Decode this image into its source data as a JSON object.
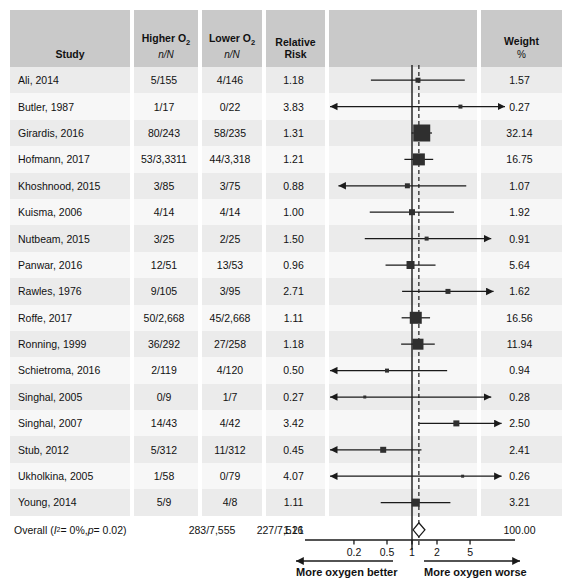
{
  "header": {
    "study": "Study",
    "higher_o2": "Higher O",
    "higher_o2_sub": "2",
    "higher_o2_unit": "n/N",
    "lower_o2": "Lower O",
    "lower_o2_sub": "2",
    "lower_o2_unit": "n/N",
    "relative_risk_l1": "Relative",
    "relative_risk_l2": "Risk",
    "weight_l1": "Weight",
    "weight_l2": "%"
  },
  "rows": [
    {
      "study": "Ali, 2014",
      "higher": "5/155",
      "lower": "4/146",
      "rr": "1.18",
      "weight": "1.57",
      "est": 1.18,
      "lo": 0.32,
      "hi": 4.32,
      "box": 5,
      "loArrow": false,
      "hiArrow": false
    },
    {
      "study": "Butler, 1987",
      "higher": "1/17",
      "lower": "0/22",
      "rr": "3.83",
      "weight": "0.27",
      "est": 3.83,
      "lo": 0.1,
      "hi": 30.0,
      "box": 4,
      "loArrow": true,
      "hiArrow": true
    },
    {
      "study": "Girardis, 2016",
      "higher": "80/243",
      "lower": "58/235",
      "rr": "1.31",
      "weight": "32.14",
      "est": 1.31,
      "lo": 0.99,
      "hi": 1.74,
      "box": 17,
      "loArrow": false,
      "hiArrow": false
    },
    {
      "study": "Hofmann, 2017",
      "higher": "53/3,3311",
      "lower": "44/3,318",
      "rr": "1.21",
      "weight": "16.75",
      "est": 1.21,
      "lo": 0.81,
      "hi": 1.8,
      "box": 12,
      "loArrow": false,
      "hiArrow": false
    },
    {
      "study": "Khoshnood, 2015",
      "higher": "3/85",
      "lower": "3/75",
      "rr": "0.88",
      "weight": "1.07",
      "est": 0.88,
      "lo": 0.13,
      "hi": 4.5,
      "box": 5,
      "loArrow": true,
      "hiArrow": false
    },
    {
      "study": "Kuisma, 2006",
      "higher": "4/14",
      "lower": "4/14",
      "rr": "1.00",
      "weight": "1.92",
      "est": 1.0,
      "lo": 0.31,
      "hi": 3.2,
      "box": 6,
      "loArrow": false,
      "hiArrow": false
    },
    {
      "study": "Nutbeam, 2015",
      "higher": "3/25",
      "lower": "2/25",
      "rr": "1.50",
      "weight": "0.91",
      "est": 1.5,
      "lo": 0.27,
      "hi": 9.0,
      "box": 4,
      "loArrow": false,
      "hiArrow": true
    },
    {
      "study": "Panwar, 2016",
      "higher": "12/51",
      "lower": "13/53",
      "rr": "0.96",
      "weight": "5.64",
      "est": 0.96,
      "lo": 0.48,
      "hi": 1.92,
      "box": 8,
      "loArrow": false,
      "hiArrow": false
    },
    {
      "study": "Rawles, 1976",
      "higher": "9/105",
      "lower": "3/95",
      "rr": "2.71",
      "weight": "1.62",
      "est": 2.71,
      "lo": 0.76,
      "hi": 9.6,
      "box": 5,
      "loArrow": false,
      "hiArrow": true
    },
    {
      "study": "Roffe, 2017",
      "higher": "50/2,668",
      "lower": "45/2,668",
      "rr": "1.11",
      "weight": "16.56",
      "est": 1.11,
      "lo": 0.75,
      "hi": 1.65,
      "box": 12,
      "loArrow": false,
      "hiArrow": false
    },
    {
      "study": "Ronning, 1999",
      "higher": "36/292",
      "lower": "27/258",
      "rr": "1.18",
      "weight": "11.94",
      "est": 1.18,
      "lo": 0.74,
      "hi": 1.88,
      "box": 11,
      "loArrow": false,
      "hiArrow": false
    },
    {
      "study": "Schietroma, 2016",
      "higher": "2/119",
      "lower": "4/120",
      "rr": "0.50",
      "weight": "0.94",
      "est": 0.5,
      "lo": 0.09,
      "hi": 2.65,
      "box": 4,
      "loArrow": true,
      "hiArrow": false
    },
    {
      "study": "Singhal, 2005",
      "higher": "0/9",
      "lower": "1/7",
      "rr": "0.27",
      "weight": "0.28",
      "est": 0.27,
      "lo": 0.09,
      "hi": 9.0,
      "box": 3,
      "loArrow": true,
      "hiArrow": true
    },
    {
      "study": "Singhal, 2007",
      "higher": "14/43",
      "lower": "4/42",
      "rr": "3.42",
      "weight": "2.50",
      "est": 3.42,
      "lo": 1.22,
      "hi": 12.0,
      "box": 6,
      "loArrow": false,
      "hiArrow": true
    },
    {
      "study": "Stub, 2012",
      "higher": "5/312",
      "lower": "11/312",
      "rr": "0.45",
      "weight": "2.41",
      "est": 0.45,
      "lo": 0.1,
      "hi": 1.3,
      "box": 6,
      "loArrow": true,
      "hiArrow": false
    },
    {
      "study": "Ukholkina, 2005",
      "higher": "1/58",
      "lower": "0/79",
      "rr": "4.07",
      "weight": "0.26",
      "est": 4.07,
      "lo": 0.09,
      "hi": 12.0,
      "box": 3,
      "loArrow": true,
      "hiArrow": true
    },
    {
      "study": "Young, 2014",
      "higher": "5/9",
      "lower": "4/8",
      "rr": "1.11",
      "weight": "3.21",
      "est": 1.11,
      "lo": 0.42,
      "hi": 2.9,
      "box": 8,
      "loArrow": false,
      "hiArrow": false
    }
  ],
  "overall": {
    "label_prefix": "Overall (",
    "i_symbol": "I",
    "i_sup": "2",
    "i_value": " = 0%, ",
    "p_symbol": "p",
    "p_value": " = 0.02)",
    "higher": "283/7,555",
    "lower": "227/7,516",
    "rr": "1.21",
    "weight": "100.00",
    "est": 1.21,
    "lo": 1.03,
    "hi": 1.43
  },
  "axis": {
    "ticks": [
      "0.2",
      "0.5",
      "1",
      "2",
      "5"
    ],
    "tick_values": [
      0.2,
      0.5,
      1,
      2,
      5
    ],
    "left_label": "More oxygen better",
    "right_label": "More oxygen worse",
    "null_line_value": 1,
    "pooled_line_value": 1.21,
    "xmin": 0.09,
    "xmax": 12.5
  },
  "colors": {
    "header_bg": "#c9c9c9",
    "row_stripe": "#ececec",
    "marker": "#2f2f2f",
    "line": "#1a1a1a",
    "text": "#111111"
  },
  "chart_data": {
    "type": "forest",
    "title": "",
    "xlabel": "Relative Risk",
    "x_scale": "log",
    "xlim": [
      0.09,
      12.5
    ],
    "xticks": [
      0.2,
      0.5,
      1,
      2,
      5
    ],
    "reference_line": 1,
    "pooled_line": 1.21,
    "categories": [
      "Ali, 2014",
      "Butler, 1987",
      "Girardis, 2016",
      "Hofmann, 2017",
      "Khoshnood, 2015",
      "Kuisma, 2006",
      "Nutbeam, 2015",
      "Panwar, 2016",
      "Rawles, 1976",
      "Roffe, 2017",
      "Ronning, 1999",
      "Schietroma, 2016",
      "Singhal, 2005",
      "Singhal, 2007",
      "Stub, 2012",
      "Ukholkina, 2005",
      "Young, 2014"
    ],
    "values": [
      1.18,
      3.83,
      1.31,
      1.21,
      0.88,
      1.0,
      1.5,
      0.96,
      2.71,
      1.11,
      1.18,
      0.5,
      0.27,
      3.42,
      0.45,
      4.07,
      1.11
    ],
    "weights": [
      1.57,
      0.27,
      32.14,
      16.75,
      1.07,
      1.92,
      0.91,
      5.64,
      1.62,
      16.56,
      11.94,
      0.94,
      0.28,
      2.5,
      2.41,
      0.26,
      3.21
    ],
    "overall_value": 1.21,
    "overall_weight": 100.0
  }
}
